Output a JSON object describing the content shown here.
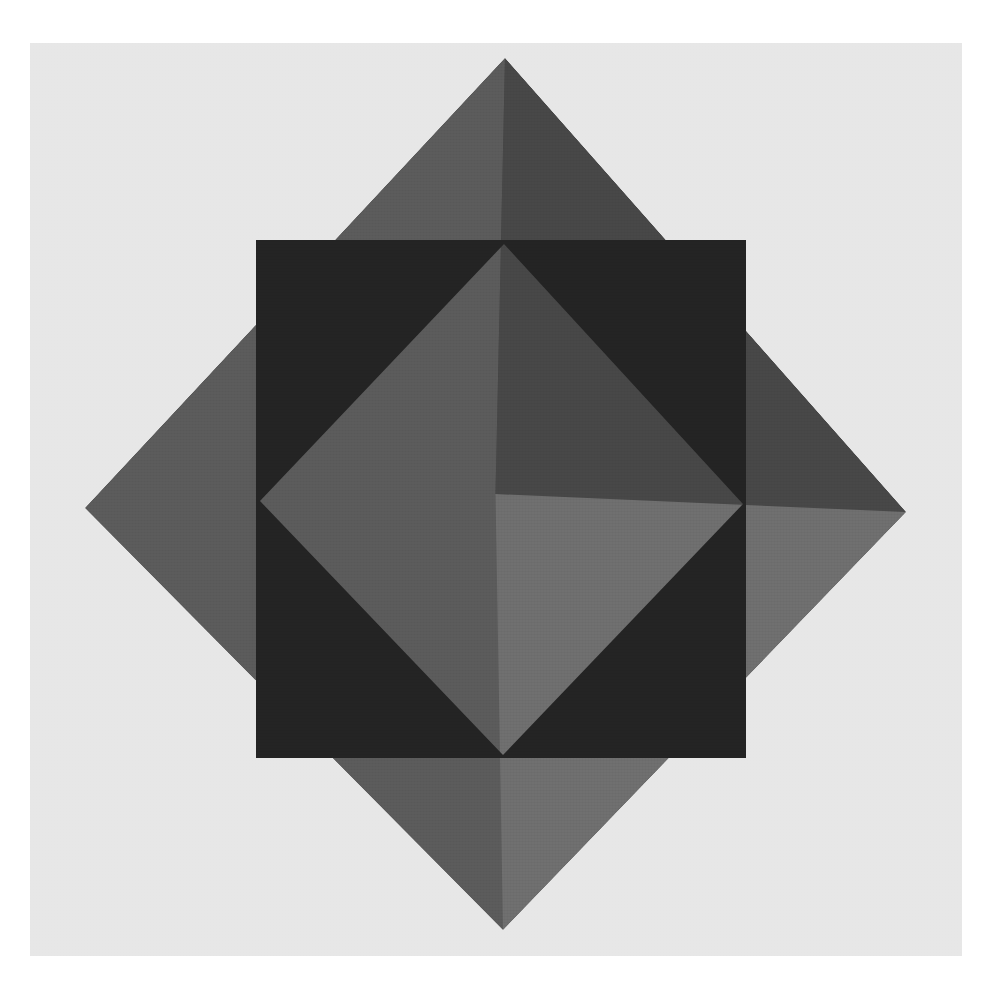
{
  "canvas": {
    "width": 990,
    "height": 984,
    "margin_color": "#ffffff",
    "title": "Overlapping Square and Rotated Square Composition"
  },
  "artboard": {
    "x": 30,
    "y": 43,
    "width": 932,
    "height": 913,
    "background_color": "#e7e7e7"
  },
  "shapes": {
    "rotated_square": {
      "name": "rotated-square-diamond",
      "vertices": {
        "top": [
          505,
          58
        ],
        "right": [
          906,
          512
        ],
        "bottom": [
          503,
          930
        ],
        "left": [
          85,
          508
        ]
      },
      "quadrant_colors": {
        "top": "#3b3b3b",
        "right": "#464646",
        "bottom": "#6d6d6d",
        "left": "#5a5a5a"
      },
      "note": "Square rotated 45 degrees, rendered as translucent grey tones"
    },
    "dark_square": {
      "name": "dark-square",
      "x": 256,
      "y": 240,
      "width": 490,
      "height": 518,
      "color": "#232323"
    },
    "inner_diamond": {
      "name": "inner-light-diamond",
      "vertices": {
        "top": [
          504,
          244
        ],
        "right": [
          743,
          504
        ],
        "bottom": [
          503,
          755
        ],
        "left": [
          260,
          501
        ]
      },
      "color": "#e9e9e9",
      "note": "Light diamond hole inscribed within the dark square"
    }
  },
  "palette": {
    "white": "#ffffff",
    "panel_grey": "#e7e7e7",
    "light_diamond": "#e9e9e9",
    "mid_grey": "#6d6d6d",
    "grey": "#5a5a5a",
    "dark_grey": "#464646",
    "charcoal": "#3b3b3b",
    "near_black": "#232323"
  }
}
